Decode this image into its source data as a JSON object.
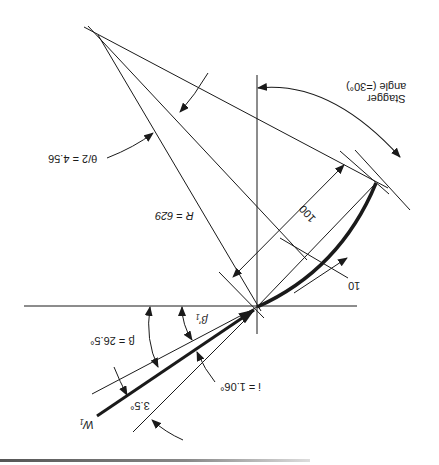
{
  "figure": {
    "orientation_degrees": 180
  },
  "labels": {
    "stagger": "Stagger",
    "stagger_angle": "angle (=30°)",
    "chord": "100",
    "camber_height": "10",
    "radius": "R = 629",
    "half_camber": "θ/2 = 4.56",
    "beta": "β = 26.5°",
    "beta_prime": "β′₁",
    "incidence": "i = 1.06°",
    "deviation": "3.5°",
    "velocity": "W₁"
  },
  "colors": {
    "line": "#1a1a1a",
    "background": "#ffffff"
  }
}
